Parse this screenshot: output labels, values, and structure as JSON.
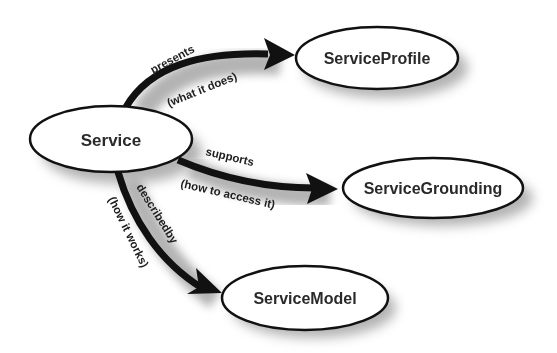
{
  "diagram": {
    "nodes": {
      "service": {
        "label": "Service"
      },
      "profile": {
        "label": "ServiceProfile"
      },
      "grounding": {
        "label": "ServiceGrounding"
      },
      "model": {
        "label": "ServiceModel"
      }
    },
    "edges": {
      "presents": {
        "from": "Service",
        "to": "ServiceProfile",
        "label": "presents",
        "sublabel": "(what it does)"
      },
      "supports": {
        "from": "Service",
        "to": "ServiceGrounding",
        "label": "supports",
        "sublabel": "(how to access it)"
      },
      "describedby": {
        "from": "Service",
        "to": "ServiceModel",
        "label": "describedby",
        "sublabel": "(how it works)"
      }
    },
    "colors": {
      "stroke": "#111111",
      "node_fill": "#ffffff",
      "shadow": "#9a9a9a",
      "text": "#2a2a2a"
    }
  }
}
